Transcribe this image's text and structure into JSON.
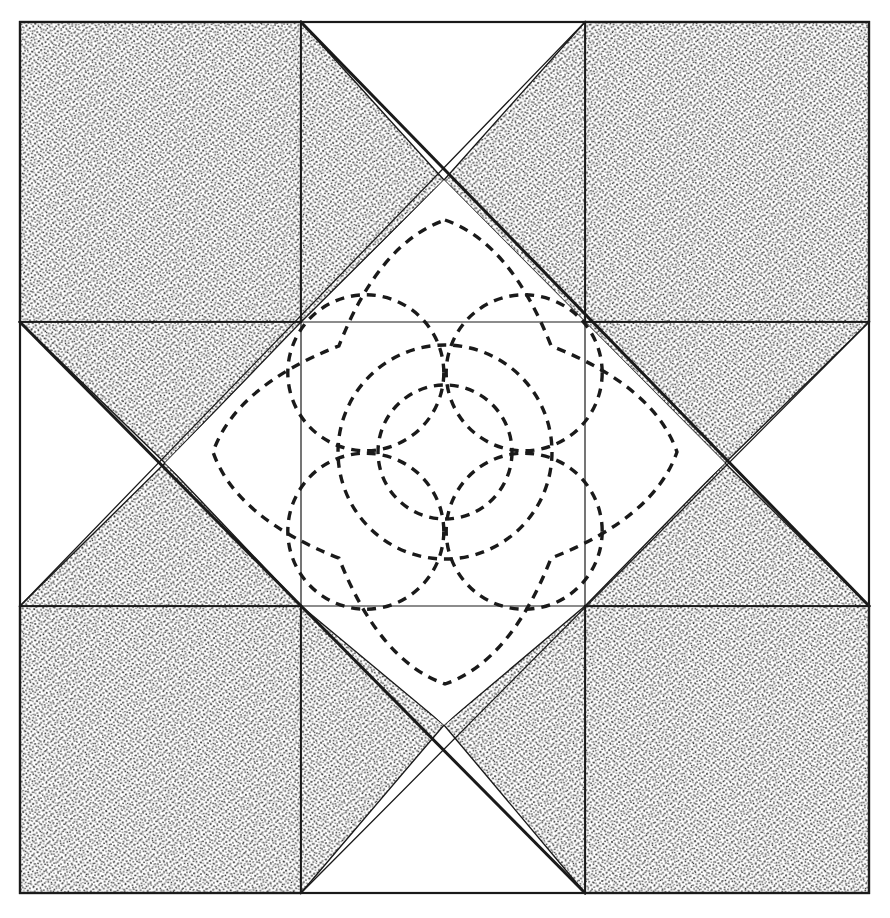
{
  "document": {
    "kind": "quilt-block-pattern-diagram",
    "title": "Variable Star quilt block with feathered rose quilting motif",
    "background_color": "#ffffff",
    "ink_color": "#1a1a1a",
    "stipple_color": "#3a3a3a",
    "canvas": {
      "width": 890,
      "height": 918
    }
  },
  "block": {
    "outline": {
      "x": 20,
      "y": 22,
      "width": 849,
      "height": 871,
      "stroke_width": 2.2
    },
    "grid": {
      "columns_x": [
        20,
        301,
        585,
        869
      ],
      "rows_y": [
        22,
        322,
        606,
        893
      ],
      "rows": 3,
      "columns": 3
    },
    "corner_patches": [
      {
        "name": "corner-top-left",
        "x": 20,
        "y": 22,
        "width": 281,
        "height": 300,
        "fill": "stipple"
      },
      {
        "name": "corner-top-right",
        "x": 585,
        "y": 22,
        "width": 284,
        "height": 300,
        "fill": "stipple"
      },
      {
        "name": "corner-bottom-left",
        "x": 20,
        "y": 606,
        "width": 281,
        "height": 287,
        "fill": "stipple"
      },
      {
        "name": "corner-bottom-right",
        "x": 585,
        "y": 606,
        "width": 284,
        "height": 287,
        "fill": "stipple"
      }
    ],
    "edge_triangles": [
      {
        "name": "edge-top",
        "points": "301,22 585,22 444,180",
        "fill": "stipple",
        "white_points": "301,22 444,180 301,322 585,322 585,22 444,180"
      },
      {
        "name": "edge-left",
        "points": "20,322 20,606 165,463",
        "fill": "stipple"
      },
      {
        "name": "edge-right",
        "points": "869,322 869,606 725,463",
        "fill": "stipple"
      },
      {
        "name": "edge-bottom",
        "points": "301,893 585,893 444,725",
        "fill": "stipple"
      }
    ],
    "center_diamond": {
      "name": "center-diamond",
      "vertices": [
        [
          444,
          180
        ],
        [
          725,
          463
        ],
        [
          444,
          725
        ],
        [
          165,
          463
        ]
      ],
      "fill": "#ffffff",
      "stroke_thick": 3.0,
      "stroke_thin": 1.3
    },
    "diagonal_lines": [
      {
        "name": "diagonal-ne",
        "from": [
          301,
          22
        ],
        "to": [
          869,
          606
        ],
        "stroke_width": 3.0
      },
      {
        "name": "diagonal-se",
        "from": [
          585,
          22
        ],
        "to": [
          20,
          606
        ],
        "stroke_width": 1.3
      },
      {
        "name": "diagonal-sw",
        "from": [
          301,
          893
        ],
        "to": [
          869,
          322
        ],
        "stroke_width": 1.3
      },
      {
        "name": "diagonal-nw",
        "from": [
          585,
          893
        ],
        "to": [
          20,
          322
        ],
        "stroke_width": 3.0
      }
    ]
  },
  "quilting_motif": {
    "name": "feathered-rose",
    "style": {
      "stroke": "#1a1a1a",
      "stroke_width": 3.4,
      "dash": "9 7",
      "fill": "none"
    },
    "center": [
      445,
      452
    ],
    "outer_star": {
      "name": "scalloped-four-point-star",
      "points": 4,
      "tip_radius": 232,
      "valley_radius": 150,
      "tip_angles_deg": [
        270,
        0,
        90,
        180
      ]
    },
    "petal_circles": {
      "name": "petal-circle-ring",
      "count": 4,
      "radius": 78,
      "orbit_radius": 112,
      "angles_deg": [
        225,
        315,
        45,
        135
      ]
    },
    "middle_circle": {
      "name": "middle-circle",
      "radius": 107
    },
    "inner_circle": {
      "name": "inner-circle",
      "radius": 67
    }
  }
}
